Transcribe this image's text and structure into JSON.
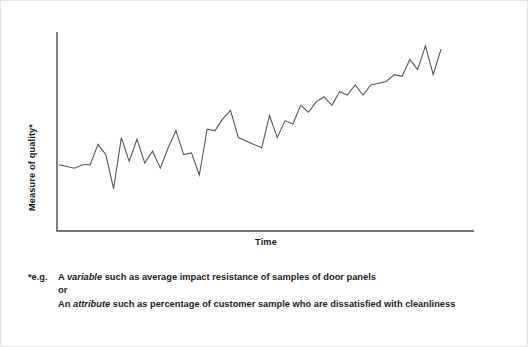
{
  "figure": {
    "background_color": "#ffffff",
    "border_color": "#e6e6e6",
    "line_color": "#585858",
    "axis_color": "#4a4a4a",
    "text_color": "#1c1c1c"
  },
  "axes": {
    "y_label": "Measure of quality*",
    "x_label": "Time"
  },
  "footnote": {
    "marker": "*e.g.",
    "line1_pre": "A ",
    "line1_em": "variable",
    "line1_post": " such as average impact resistance of samples of door panels",
    "line2": "or",
    "line3_pre": "An ",
    "line3_em": "attribute",
    "line3_post": " such as percentage of customer sample who are dissatisfied with cleanliness"
  },
  "chart_data": {
    "type": "line",
    "title": "",
    "xlabel": "Time",
    "ylabel": "Measure of quality*",
    "grid": false,
    "legend": false,
    "xlim": [
      0,
      49
    ],
    "ylim": [
      0,
      100
    ],
    "axis_ticks": {
      "x": [],
      "y": []
    },
    "series": [
      {
        "name": "Measure of quality",
        "x": [
          0,
          1,
          2,
          3,
          4,
          5,
          6,
          7,
          8,
          9,
          10,
          11,
          12,
          13,
          14,
          15,
          16,
          17,
          18,
          19,
          20,
          21,
          22,
          23,
          24,
          25,
          26,
          27,
          28,
          29,
          30,
          31,
          32,
          33,
          34,
          35,
          36,
          37,
          38,
          39,
          40,
          41,
          42,
          43,
          44,
          45,
          46,
          47,
          48,
          49
        ],
        "values": [
          26,
          25,
          24,
          26,
          26,
          38,
          32,
          12,
          42,
          28,
          41,
          27,
          34,
          24,
          36,
          46,
          32,
          33,
          20,
          47,
          46,
          53,
          58,
          42,
          40,
          38,
          36,
          55,
          42,
          52,
          50,
          61,
          57,
          63,
          66,
          61,
          69,
          67,
          73,
          67,
          73,
          74,
          75,
          79,
          78,
          88,
          82,
          96,
          79,
          94
        ]
      }
    ],
    "annotations": [
      "Upward-trending noisy time series illustrating improvement in a quality measure over time"
    ]
  }
}
